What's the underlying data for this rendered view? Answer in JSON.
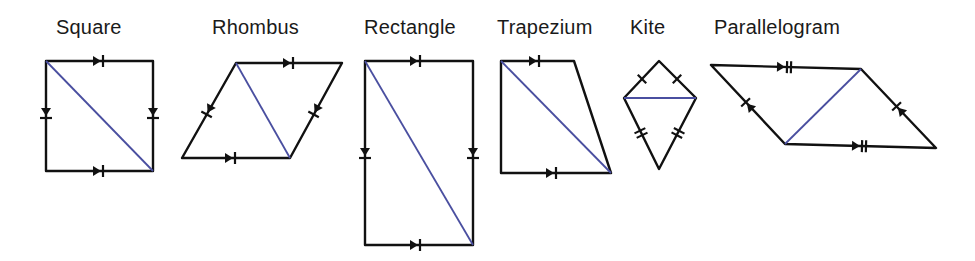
{
  "diagram": {
    "colors": {
      "edge": "#111111",
      "diagonal": "#4a4fa0",
      "label": "#1a1a1a",
      "background": "#ffffff"
    },
    "shapes": [
      {
        "name": "Square",
        "label": "Square",
        "vertices": [
          [
            46,
            61
          ],
          [
            153,
            61
          ],
          [
            153,
            171
          ],
          [
            46,
            171
          ]
        ],
        "diagonal": [
          [
            46,
            61
          ],
          [
            153,
            171
          ]
        ],
        "markings": "single arrow (parallel) + single tick (equal) on all sides"
      },
      {
        "name": "Rhombus",
        "label": "Rhombus",
        "vertices": [
          [
            236,
            63
          ],
          [
            342,
            63
          ],
          [
            290,
            158
          ],
          [
            182,
            158
          ]
        ],
        "diagonal": [
          [
            236,
            63
          ],
          [
            290,
            158
          ]
        ],
        "markings": "single arrow + single tick on all sides"
      },
      {
        "name": "Rectangle",
        "label": "Rectangle",
        "vertices": [
          [
            365,
            61
          ],
          [
            473,
            61
          ],
          [
            473,
            245
          ],
          [
            365,
            245
          ]
        ],
        "diagonal": [
          [
            365,
            61
          ],
          [
            473,
            245
          ]
        ],
        "markings": "arrow + tick on all sides"
      },
      {
        "name": "Trapezium",
        "label": "Trapezium",
        "vertices": [
          [
            501,
            61
          ],
          [
            574,
            61
          ],
          [
            611,
            173
          ],
          [
            501,
            173
          ]
        ],
        "diagonal": [
          [
            501,
            61
          ],
          [
            611,
            173
          ]
        ],
        "markings": "arrows on parallel top and bottom sides"
      },
      {
        "name": "Kite",
        "label": "Kite",
        "vertices": [
          [
            659,
            61
          ],
          [
            696,
            98
          ],
          [
            659,
            169
          ],
          [
            624,
            98
          ]
        ],
        "diagonal": [
          [
            624,
            98
          ],
          [
            696,
            98
          ]
        ],
        "markings": "single ticks on upper sides, double ticks on lower sides"
      },
      {
        "name": "Parallelogram",
        "label": "Parallelogram",
        "vertices": [
          [
            711,
            65
          ],
          [
            861,
            69
          ],
          [
            936,
            148
          ],
          [
            785,
            144
          ]
        ],
        "diagonal": [
          [
            785,
            144
          ],
          [
            861,
            69
          ]
        ],
        "markings": "double arrow-ticks on long sides, single arrow-tick on short sides"
      }
    ]
  }
}
